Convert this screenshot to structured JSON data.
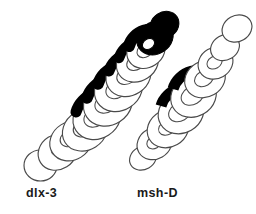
{
  "figure": {
    "type": "diagram",
    "background_color": "#ffffff",
    "outline_color": "#4a4a4a",
    "expression_color": "#000000",
    "label_color": "#1a1a1a",
    "panels": [
      {
        "id": "panel-left",
        "label": "dlx-3",
        "segment_count": 11,
        "expression_band_count": 7,
        "description": "chain of overlapping rings running lower-left to upper-right with solid black expression bands on the upper segments"
      },
      {
        "id": "panel-right",
        "label": "msh-D",
        "segment_count": 9,
        "expression_band_count": 2,
        "description": "chain of overlapping open rings with two solid black expression bands in the middle region"
      }
    ]
  },
  "labels": {
    "left": "dlx-3",
    "right": "msh-D"
  }
}
